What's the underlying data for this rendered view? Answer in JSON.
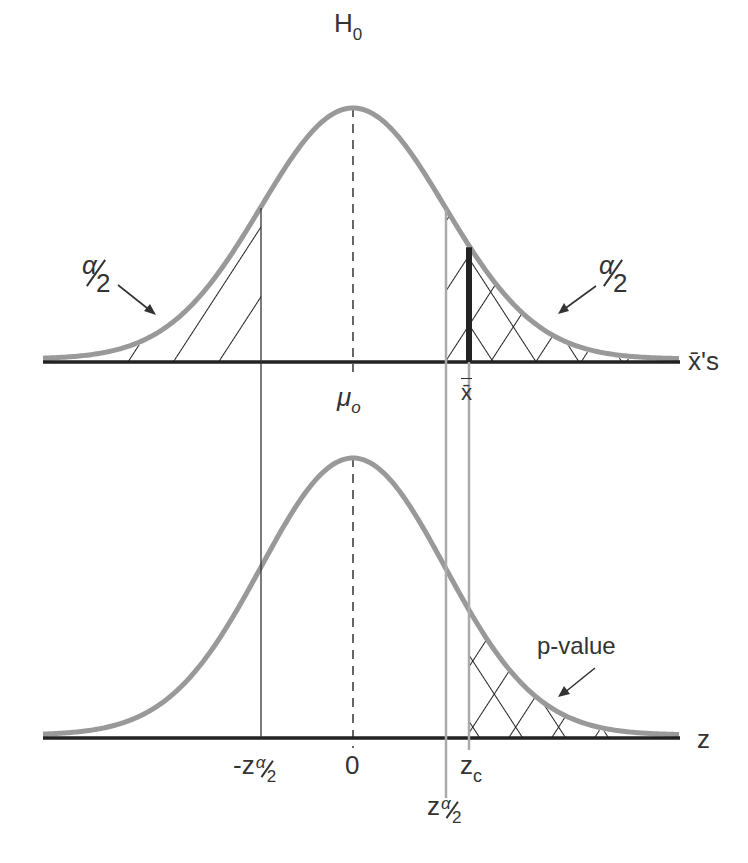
{
  "diagram": {
    "top_panel": {
      "hypothesis_label": "H",
      "hypothesis_sub": "0",
      "axis_label": "x̄'s",
      "center_label": "μ",
      "center_sub": "o",
      "sample_mean_label": "x̄",
      "left_tail_label": {
        "num": "α",
        "den": "2"
      },
      "right_tail_label": {
        "num": "α",
        "den": "2"
      }
    },
    "bottom_panel": {
      "axis_label": "z",
      "neg_crit_label": {
        "prefix": "-z",
        "num": "α",
        "den": "2"
      },
      "zero_label": "0",
      "pos_crit_label": {
        "prefix": "z",
        "num": "α",
        "den": "2"
      },
      "zc_label": "z",
      "zc_sub": "c",
      "pvalue_label": "p-value"
    },
    "colors": {
      "curve": "#999999",
      "axis": "#222222",
      "hatch": "#222222",
      "guide": "#333333",
      "crit_line": "#aaaaaa",
      "text": "#333333"
    },
    "geometry": {
      "mu_x": 353,
      "sigma_px": 92,
      "top_baseline": 362,
      "top_peak": 108,
      "bottom_baseline": 738,
      "bottom_peak": 458,
      "x_left": 43,
      "x_right": 680,
      "neg_crit_x": 261,
      "pos_crit_x": 446,
      "xbar_x": 469
    }
  }
}
